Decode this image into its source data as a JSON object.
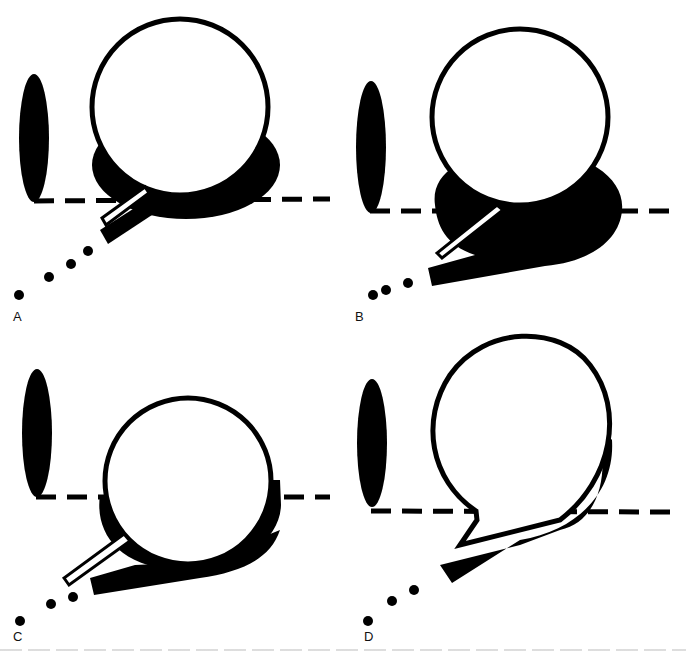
{
  "figure": {
    "panels": [
      {
        "id": "A",
        "label": "A"
      },
      {
        "id": "B",
        "label": "B"
      },
      {
        "id": "C",
        "label": "C"
      },
      {
        "id": "D",
        "label": "D"
      }
    ],
    "colors": {
      "ink": "#000000",
      "paper": "#ffffff"
    }
  }
}
